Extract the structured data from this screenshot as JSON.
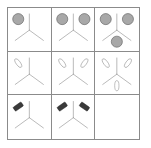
{
  "puzzle": {
    "title": "Visual analogy matrix puzzle",
    "type": "progressive-matrix",
    "rows": 3,
    "columns": 3,
    "canvas_width": 151,
    "canvas_height": 148,
    "colors": {
      "background": "#ffffff",
      "grid_line": "#8b8b8b",
      "outer_border": "#8b8b8b",
      "tripod_stroke": "#9a9a9a",
      "circle_fill": "#a8a8a8",
      "circle_stroke": "#5a5a5a",
      "ellipse_fill": "#ffffff",
      "ellipse_stroke": "#8f8f8f",
      "rect_fill": "#3a3a3a",
      "rect_stroke": "#222222"
    },
    "figure": {
      "name": "tripod",
      "description": "Y-shaped three-armed figure: one arm up, one arm down-left, one arm down-right",
      "hub_x": 50,
      "hub_y": 52,
      "arms": [
        {
          "id": "up",
          "end_x": 50,
          "end_y": 14
        },
        {
          "id": "down-left",
          "end_x": 17,
          "end_y": 76
        },
        {
          "id": "down-right",
          "end_x": 83,
          "end_y": 76
        }
      ]
    },
    "shape_types": {
      "circle": {
        "label": "gray filled circle",
        "radius": 13
      },
      "ellipse": {
        "label": "white outlined ellipse",
        "rx": 5,
        "ry": 12
      },
      "rect": {
        "label": "dark filled rectangle",
        "w": 23,
        "h": 11
      }
    },
    "slots": {
      "upper_left": {
        "cx": 24,
        "cy": 26,
        "angle": -35
      },
      "upper_right": {
        "cx": 76,
        "cy": 26,
        "angle": 35
      },
      "bottom": {
        "cx": 50,
        "cy": 79,
        "angle": 0
      }
    },
    "cells": [
      {
        "id": "r1c1",
        "row": 1,
        "column": 1,
        "name": "cell-row1-col1",
        "shape": "circle",
        "count": 1,
        "occupied_slots": [
          "upper_left"
        ],
        "empty": false
      },
      {
        "id": "r1c2",
        "row": 1,
        "column": 2,
        "name": "cell-row1-col2",
        "shape": "circle",
        "count": 2,
        "occupied_slots": [
          "upper_left",
          "upper_right"
        ],
        "empty": false
      },
      {
        "id": "r1c3",
        "row": 1,
        "column": 3,
        "name": "cell-row1-col3",
        "shape": "circle",
        "count": 3,
        "occupied_slots": [
          "upper_left",
          "upper_right",
          "bottom"
        ],
        "empty": false
      },
      {
        "id": "r2c1",
        "row": 2,
        "column": 1,
        "name": "cell-row2-col1",
        "shape": "ellipse",
        "count": 1,
        "occupied_slots": [
          "upper_left"
        ],
        "empty": false
      },
      {
        "id": "r2c2",
        "row": 2,
        "column": 2,
        "name": "cell-row2-col2",
        "shape": "ellipse",
        "count": 2,
        "occupied_slots": [
          "upper_left",
          "upper_right"
        ],
        "empty": false
      },
      {
        "id": "r2c3",
        "row": 2,
        "column": 3,
        "name": "cell-row2-col3",
        "shape": "ellipse",
        "count": 3,
        "occupied_slots": [
          "upper_left",
          "upper_right",
          "bottom"
        ],
        "empty": false
      },
      {
        "id": "r3c1",
        "row": 3,
        "column": 1,
        "name": "cell-row3-col1",
        "shape": "rect",
        "count": 1,
        "occupied_slots": [
          "upper_left"
        ],
        "empty": false
      },
      {
        "id": "r3c2",
        "row": 3,
        "column": 2,
        "name": "cell-row3-col2",
        "shape": "rect",
        "count": 2,
        "occupied_slots": [
          "upper_left",
          "upper_right"
        ],
        "empty": false
      },
      {
        "id": "r3c3",
        "row": 3,
        "column": 3,
        "name": "cell-row3-col3-answer",
        "shape": "rect",
        "count": 0,
        "occupied_slots": [],
        "empty": true
      }
    ]
  }
}
